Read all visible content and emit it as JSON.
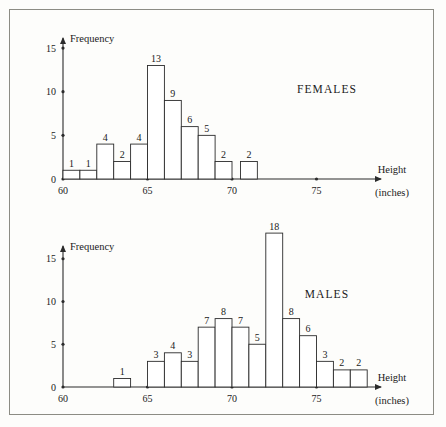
{
  "figure": {
    "border_color": "#8c8c84",
    "background": "#fdfdfb",
    "ink_color": "#2b2b2b"
  },
  "charts": [
    {
      "id": "females-histogram",
      "series_name": "FEMALES",
      "y_axis_title": "Frequency",
      "x_axis_title": "Height",
      "x_axis_unit": "(inches)",
      "y_ticks": [
        "0",
        "5",
        "10",
        "15"
      ],
      "x_ticks": [
        "60",
        "65",
        "70",
        "75"
      ],
      "bar_labels": [
        "1",
        "1",
        "4",
        "2",
        "4",
        "13",
        "9",
        "6",
        "5",
        "2",
        "2"
      ]
    },
    {
      "id": "males-histogram",
      "series_name": "MALES",
      "y_axis_title": "Frequency",
      "x_axis_title": "Height",
      "x_axis_unit": "(inches)",
      "y_ticks": [
        "0",
        "5",
        "10",
        "15"
      ],
      "x_ticks": [
        "60",
        "65",
        "70",
        "75"
      ],
      "bar_labels": [
        "1",
        "3",
        "4",
        "3",
        "7",
        "8",
        "7",
        "5",
        "18",
        "8",
        "6",
        "3",
        "2",
        "2"
      ]
    }
  ],
  "chart_data": [
    {
      "type": "bar",
      "id": "females-histogram",
      "title": "FEMALES",
      "xlabel": "Height (inches)",
      "ylabel": "Frequency",
      "xlim": [
        59,
        78
      ],
      "ylim": [
        0,
        16
      ],
      "y_ticks": [
        0,
        5,
        10,
        15
      ],
      "x_ticks": [
        60,
        65,
        70,
        75
      ],
      "grid": false,
      "legend": "none",
      "bin_width": 1,
      "bins": [
        {
          "x0": 60,
          "x1": 61,
          "value": 1
        },
        {
          "x0": 61,
          "x1": 62,
          "value": 1
        },
        {
          "x0": 62,
          "x1": 63,
          "value": 4
        },
        {
          "x0": 63,
          "x1": 64,
          "value": 2
        },
        {
          "x0": 64,
          "x1": 65,
          "value": 4
        },
        {
          "x0": 65,
          "x1": 66,
          "value": 13
        },
        {
          "x0": 66,
          "x1": 67,
          "value": 9
        },
        {
          "x0": 67,
          "x1": 68,
          "value": 6
        },
        {
          "x0": 68,
          "x1": 69,
          "value": 5
        },
        {
          "x0": 69,
          "x1": 70,
          "value": 2
        },
        {
          "x0": 70.5,
          "x1": 71.5,
          "value": 2
        }
      ],
      "categories": [
        "60-61",
        "61-62",
        "62-63",
        "63-64",
        "64-65",
        "65-66",
        "66-67",
        "67-68",
        "68-69",
        "69-70",
        "70.5-71.5"
      ],
      "values": [
        1,
        1,
        4,
        2,
        4,
        13,
        9,
        6,
        5,
        2,
        2
      ]
    },
    {
      "type": "bar",
      "id": "males-histogram",
      "title": "MALES",
      "xlabel": "Height (inches)",
      "ylabel": "Frequency",
      "xlim": [
        59,
        78
      ],
      "ylim": [
        0,
        19
      ],
      "y_ticks": [
        0,
        5,
        10,
        15
      ],
      "x_ticks": [
        60,
        65,
        70,
        75
      ],
      "grid": false,
      "legend": "none",
      "bin_width": 1,
      "bins": [
        {
          "x0": 63,
          "x1": 64,
          "value": 1
        },
        {
          "x0": 65,
          "x1": 66,
          "value": 3
        },
        {
          "x0": 66,
          "x1": 67,
          "value": 4
        },
        {
          "x0": 67,
          "x1": 68,
          "value": 3
        },
        {
          "x0": 68,
          "x1": 69,
          "value": 7
        },
        {
          "x0": 69,
          "x1": 70,
          "value": 8
        },
        {
          "x0": 70,
          "x1": 71,
          "value": 7
        },
        {
          "x0": 71,
          "x1": 72,
          "value": 5
        },
        {
          "x0": 72,
          "x1": 73,
          "value": 18
        },
        {
          "x0": 73,
          "x1": 74,
          "value": 8
        },
        {
          "x0": 74,
          "x1": 75,
          "value": 6
        },
        {
          "x0": 75,
          "x1": 76,
          "value": 3
        },
        {
          "x0": 76,
          "x1": 77,
          "value": 2
        },
        {
          "x0": 77,
          "x1": 78,
          "value": 2
        }
      ],
      "categories": [
        "63-64",
        "65-66",
        "66-67",
        "67-68",
        "68-69",
        "69-70",
        "70-71",
        "71-72",
        "72-73",
        "73-74",
        "74-75",
        "75-76",
        "76-77",
        "77-78"
      ],
      "values": [
        1,
        3,
        4,
        3,
        7,
        8,
        7,
        5,
        18,
        8,
        6,
        3,
        2,
        2
      ]
    }
  ]
}
